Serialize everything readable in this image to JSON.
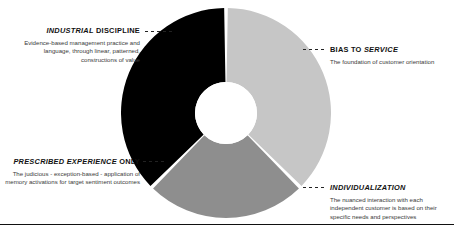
{
  "chart_data": {
    "type": "pie",
    "variant": "donut",
    "title": "",
    "center": [
      226,
      113
    ],
    "outer_radius": 105,
    "inner_radius": 31,
    "gap_degrees": 2,
    "categories": [
      "BIAS TO SERVICE",
      "INDIVIDUALIZATION",
      "INDUSTRIAL DISCIPLINE",
      "PRESCRIBED EXPERIENCE ONLY"
    ],
    "segments": [
      {
        "label": "BIAS TO SERVICE",
        "value": 33.3,
        "start_angle": 0,
        "end_angle": 135,
        "color": "#c6c6c6"
      },
      {
        "label": "INDIVIDUALIZATION",
        "value": 33.3,
        "start_angle": 135,
        "end_angle": 225,
        "color": "#8e8e8e"
      },
      {
        "label": "INDUSTRIAL DISCIPLINE",
        "value": 33.4,
        "start_angle": 225,
        "end_angle": 360,
        "color": "#000000"
      }
    ],
    "legend_position": "callouts",
    "grid": false
  },
  "callouts": {
    "industrial": {
      "heading_em": "INDUSTRIAL",
      "heading_plain": "DISCIPLINE",
      "body": "Evidence-based management practice and language, through linear, patterned, constructions of value",
      "connector": "dashed-line"
    },
    "bias": {
      "heading_plain": "BIAS TO",
      "heading_em": "SERVICE",
      "body": "The foundation of customer orientation",
      "connector": "dashed-line"
    },
    "prescribed": {
      "heading_em": "PRESCRIBED EXPERIENCE",
      "heading_plain": "ONLY",
      "body": "The judicious - exception-based - application of memory activations for target sentiment outcomes",
      "connector": "dashed-line"
    },
    "individualization": {
      "heading_em": "INDIVIDUALIZATION",
      "heading_plain": "",
      "body": "The nuanced interaction with each independent customer is based on their specific needs and perspectives",
      "connector": "dashed-line"
    }
  },
  "colors": {
    "segment_dark": "#000000",
    "segment_light": "#c6c6c6",
    "segment_mid": "#8e8e8e",
    "background": "#ffffff",
    "rule": "#111111",
    "heading_text": "#111111",
    "body_text": "#3a3a3a"
  }
}
